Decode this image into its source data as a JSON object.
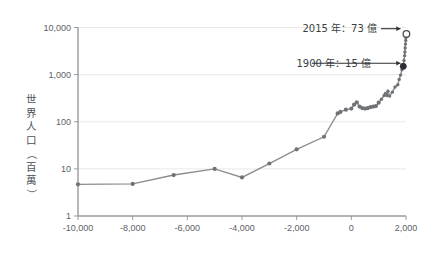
{
  "chart_data": {
    "type": "line",
    "title": "",
    "subtitle": "",
    "xlabel": "",
    "ylabel": "世界人口（百萬）",
    "ylabel_chars": [
      "世",
      "界",
      "人",
      "口",
      "（",
      "百",
      "萬",
      "）"
    ],
    "scale": {
      "x": "linear",
      "y": "log10"
    },
    "xlim": [
      -10000,
      2000
    ],
    "ylim": [
      1,
      10000
    ],
    "grid": {
      "x": false,
      "y": true
    },
    "legend": {
      "show": false,
      "position": "none"
    },
    "xticks": [
      -10000,
      -8000,
      -6000,
      -4000,
      -2000,
      0,
      2000
    ],
    "xtick_labels": [
      "-10,000",
      "-8,000",
      "-6,000",
      "-4,000",
      "-2,000",
      "0",
      "2,000"
    ],
    "yticks": [
      1,
      10,
      100,
      1000,
      10000
    ],
    "ytick_labels": [
      "1",
      "10",
      "100",
      "1,000",
      "10,000"
    ],
    "colors": {
      "line": "#8a8d90",
      "dot": "#6f7276",
      "grid": "#ebe8e6",
      "axis": "#9a9a9a",
      "annotation": "#2d3135",
      "marker_filled": "#2b2f33",
      "marker_hollow": "#ffffff",
      "background": "#ffffff"
    },
    "series": [
      {
        "name": "世界人口",
        "unit": "百萬",
        "points": [
          [
            -10000,
            4.7
          ],
          [
            -8000,
            4.8
          ],
          [
            -6500,
            7.4
          ],
          [
            -5000,
            10.0
          ],
          [
            -4000,
            6.6
          ],
          [
            -3000,
            13.0
          ],
          [
            -2000,
            26.0
          ],
          [
            -1000,
            48.0
          ],
          [
            -500,
            150.0
          ],
          [
            -400,
            162.0
          ],
          [
            -200,
            180.0
          ],
          [
            1,
            190.0
          ],
          [
            100,
            230.0
          ],
          [
            200,
            257.0
          ],
          [
            300,
            210.0
          ],
          [
            400,
            195.0
          ],
          [
            500,
            190.0
          ],
          [
            600,
            195.0
          ],
          [
            700,
            205.0
          ],
          [
            800,
            210.0
          ],
          [
            900,
            215.0
          ],
          [
            1000,
            254.0
          ],
          [
            1100,
            301.0
          ],
          [
            1200,
            360.0
          ],
          [
            1250,
            400.0
          ],
          [
            1300,
            360.0
          ],
          [
            1340,
            443.0
          ],
          [
            1400,
            350.0
          ],
          [
            1500,
            425.0
          ],
          [
            1600,
            545.0
          ],
          [
            1700,
            610.0
          ],
          [
            1750,
            791.0
          ],
          [
            1800,
            978.0
          ],
          [
            1850,
            1262.0
          ],
          [
            1900,
            1500.0
          ],
          [
            1927,
            2000.0
          ],
          [
            1950,
            2525.0
          ],
          [
            1960,
            3018.0
          ],
          [
            1970,
            3682.0
          ],
          [
            1980,
            4440.0
          ],
          [
            1990,
            5310.0
          ],
          [
            2000,
            6127.0
          ],
          [
            2010,
            6930.0
          ],
          [
            2015,
            7300.0
          ]
        ]
      }
    ],
    "annotations": [
      {
        "id": "annot-2015",
        "text": "2015 年：73 億",
        "year": 2015,
        "value_millions": 7300,
        "value_label": "73 億",
        "marker": "hollow-circle"
      },
      {
        "id": "annot-1900",
        "text": "1900 年：15 億",
        "year": 1900,
        "value_millions": 1500,
        "value_label": "15 億",
        "marker": "filled-circle"
      }
    ]
  }
}
